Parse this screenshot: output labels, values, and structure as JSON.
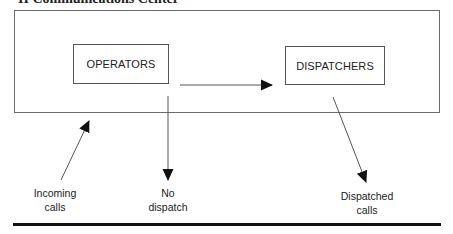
{
  "title": "II Communications Center",
  "nodes": {
    "operators": {
      "label": "OPERATORS"
    },
    "dispatchers": {
      "label": "DISPATCHERS"
    }
  },
  "labels": {
    "incoming": {
      "line1": "Incoming",
      "line2": "calls"
    },
    "no_dispatch": {
      "line1": "No",
      "line2": "dispatch"
    },
    "dispatched": {
      "line1": "Dispatched",
      "line2": "calls"
    }
  },
  "edges": [
    {
      "from": "incoming",
      "to": "operators"
    },
    {
      "from": "operators",
      "to": "dispatchers"
    },
    {
      "from": "operators",
      "to": "no_dispatch"
    },
    {
      "from": "dispatchers",
      "to": "dispatched"
    }
  ]
}
